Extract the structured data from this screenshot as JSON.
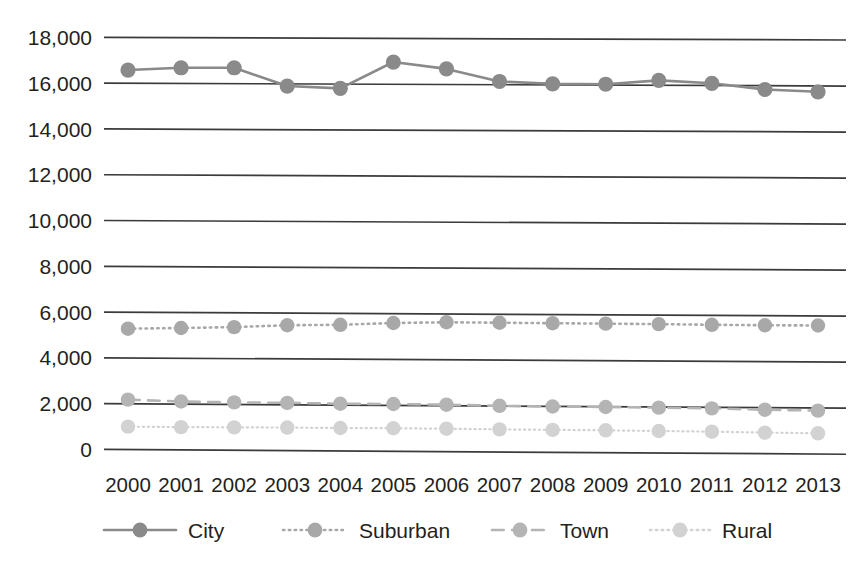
{
  "chart_data": {
    "type": "line",
    "title": "",
    "subtitle": "",
    "xlabel": "",
    "ylabel": "",
    "categories": [
      "2000",
      "2001",
      "2002",
      "2003",
      "2004",
      "2005",
      "2006",
      "2007",
      "2008",
      "2009",
      "2010",
      "2011",
      "2012",
      "2013"
    ],
    "ylim": [
      0,
      18000
    ],
    "ytick_labels": [
      "18,000",
      "16,000",
      "14,000",
      "12,000",
      "10,000",
      "8,000",
      "6,000",
      "4,000",
      "2,000",
      "0"
    ],
    "ytick_values": [
      18000,
      16000,
      14000,
      12000,
      10000,
      8000,
      6000,
      4000,
      2000,
      0
    ],
    "grid": true,
    "legend_position": "bottom",
    "series": [
      {
        "name": "City",
        "color": "#8a8a8a",
        "line_style": "solid",
        "marker": "circle",
        "values": [
          16600,
          16700,
          16700,
          15900,
          15800,
          16950,
          16650,
          16100,
          16000,
          15980,
          16150,
          16020,
          15750,
          15650
        ]
      },
      {
        "name": "Suburban",
        "color": "#a8a8a8",
        "line_style": "dotted",
        "marker": "circle",
        "values": [
          5300,
          5330,
          5370,
          5450,
          5470,
          5550,
          5580,
          5560,
          5540,
          5520,
          5500,
          5470,
          5450,
          5440
        ]
      },
      {
        "name": "Town",
        "color": "#b4b4b4",
        "line_style": "dashed",
        "marker": "circle",
        "values": [
          2200,
          2120,
          2080,
          2060,
          2020,
          2010,
          1980,
          1930,
          1900,
          1880,
          1850,
          1820,
          1760,
          1720
        ]
      },
      {
        "name": "Rural",
        "color": "#d2d2d2",
        "line_style": "dotted",
        "marker": "circle",
        "values": [
          1020,
          1000,
          990,
          980,
          960,
          950,
          930,
          900,
          880,
          860,
          830,
          800,
          760,
          730
        ]
      }
    ]
  }
}
